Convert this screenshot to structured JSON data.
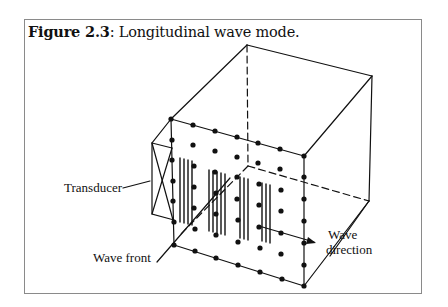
{
  "figure": {
    "label": "Figure 2.3",
    "separator": ": ",
    "title": "Longitudinal wave mode."
  },
  "annotations": {
    "transducer": "Transducer",
    "wave_front": "Wave front",
    "wave_direction_line1": "Wave",
    "wave_direction_line2": "direction"
  },
  "colors": {
    "ink": "#111111",
    "frame_border": "#8a8a8a",
    "background": "#ffffff"
  }
}
